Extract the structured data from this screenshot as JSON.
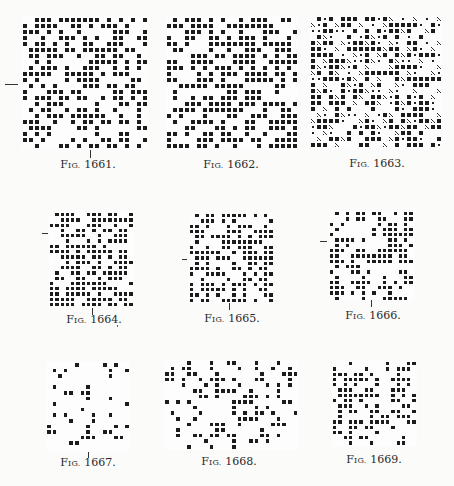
{
  "page": {
    "figures": [
      {
        "id": "fig-1661",
        "prefix": "F",
        "small": "IG.",
        "number": "1661.",
        "cols": 21,
        "rows": 22,
        "styles": [
          "black",
          "white"
        ]
      },
      {
        "id": "fig-1662",
        "prefix": "F",
        "small": "IG.",
        "number": "1662.",
        "cols": 22,
        "rows": 22,
        "styles": [
          "black",
          "white"
        ]
      },
      {
        "id": "fig-1663",
        "prefix": "F",
        "small": "IG.",
        "number": "1663.",
        "cols": 22,
        "rows": 22,
        "styles": [
          "black",
          "white",
          "hatch",
          "star"
        ]
      },
      {
        "id": "fig-1664",
        "prefix": "F",
        "small": "IG.",
        "number": "1664.",
        "cols": 16,
        "rows": 18,
        "styles": [
          "black",
          "white"
        ]
      },
      {
        "id": "fig-1665",
        "prefix": "F",
        "small": "IG.",
        "number": "1665.",
        "cols": 16,
        "rows": 17,
        "styles": [
          "black",
          "white"
        ]
      },
      {
        "id": "fig-1666",
        "prefix": "F",
        "small": "IG.",
        "number": "1666.",
        "cols": 16,
        "rows": 17,
        "styles": [
          "black",
          "white"
        ]
      },
      {
        "id": "fig-1667",
        "prefix": "F",
        "small": "IG.",
        "number": "1667.",
        "cols": 15,
        "rows": 16,
        "styles": [
          "black",
          "white"
        ]
      },
      {
        "id": "fig-1668",
        "prefix": "F",
        "small": "IG.",
        "number": "1668.",
        "cols": 24,
        "rows": 16,
        "styles": [
          "black",
          "white"
        ]
      },
      {
        "id": "fig-1669",
        "prefix": "F",
        "small": "IG.",
        "number": "1669.",
        "cols": 16,
        "rows": 16,
        "styles": [
          "black",
          "white"
        ]
      }
    ]
  }
}
